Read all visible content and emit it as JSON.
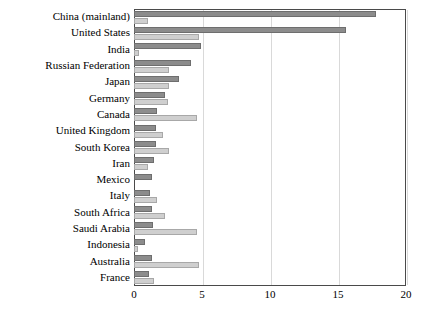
{
  "chart_data": {
    "type": "bar",
    "orientation": "horizontal",
    "title": "",
    "subtitle": "",
    "xlabel": "",
    "ylabel": "",
    "xlim": [
      0,
      20
    ],
    "ylim": null,
    "grid": true,
    "legend": null,
    "xticks": [
      0,
      5,
      10,
      15,
      20
    ],
    "xticklabels": [
      "0",
      "5",
      "10",
      "15",
      "20"
    ],
    "categories": [
      "China (mainland)",
      "United States",
      "India",
      "Russian Federation",
      "Japan",
      "Germany",
      "Canada",
      "United Kingdom",
      "South Korea",
      "Iran",
      "Mexico",
      "Italy",
      "South Africa",
      "Saudi Arabia",
      "Indonesia",
      "Australia",
      "France"
    ],
    "series": [
      {
        "name": "series-dark",
        "color": "#8c8c8c",
        "values": [
          17.8,
          15.6,
          4.9,
          4.2,
          3.3,
          2.3,
          1.7,
          1.6,
          1.6,
          1.5,
          1.3,
          1.2,
          1.3,
          1.4,
          0.8,
          1.3,
          1.1
        ]
      },
      {
        "name": "series-light",
        "color": "#cfcfcf",
        "values": [
          1.0,
          4.8,
          0.4,
          2.6,
          2.6,
          2.5,
          4.6,
          2.1,
          2.6,
          1.0,
          0.0,
          1.7,
          2.3,
          4.6,
          0.3,
          4.8,
          1.5
        ]
      }
    ]
  }
}
